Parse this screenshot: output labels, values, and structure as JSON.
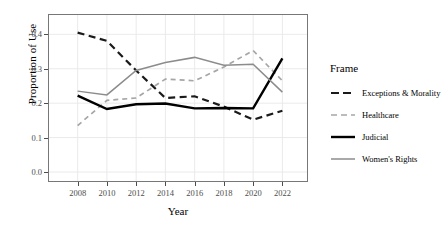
{
  "chart_data": {
    "type": "line",
    "title": "",
    "xlabel": "Year",
    "ylabel": "Proportion of Use",
    "legend_title": "Frame",
    "legend_position": "right",
    "grid": true,
    "x": [
      2008,
      2010,
      2012,
      2014,
      2016,
      2018,
      2020,
      2022
    ],
    "xticklabels": [
      "2008",
      "2010",
      "2012",
      "2014",
      "2016",
      "2018",
      "2020",
      "2022"
    ],
    "xlim": [
      2007,
      2023
    ],
    "ylim": [
      0.0,
      0.43
    ],
    "yticks": [
      0.0,
      0.1,
      0.2,
      0.3,
      0.4
    ],
    "yticklabels": [
      "0.0",
      "0.1",
      "0.2",
      "0.3",
      "0.4"
    ],
    "series": [
      {
        "name": "Exceptions & Morality",
        "values": [
          0.405,
          0.381,
          0.295,
          0.215,
          0.22,
          0.19,
          0.152,
          0.178
        ],
        "color": "#1a1a1a",
        "style": "dashed",
        "width": 2.2
      },
      {
        "name": "Healthcare",
        "values": [
          0.135,
          0.208,
          0.215,
          0.27,
          0.265,
          0.305,
          0.353,
          0.265
        ],
        "color": "#a6a6a6",
        "style": "dashed",
        "width": 1.7
      },
      {
        "name": "Judicial",
        "values": [
          0.222,
          0.183,
          0.197,
          0.199,
          0.185,
          0.186,
          0.185,
          0.33
        ],
        "color": "#000000",
        "style": "solid",
        "width": 2.4
      },
      {
        "name": "Women's Rights",
        "values": [
          0.235,
          0.224,
          0.295,
          0.318,
          0.333,
          0.31,
          0.313,
          0.232
        ],
        "color": "#8c8c8c",
        "style": "solid",
        "width": 1.5
      }
    ]
  },
  "legend": {
    "title": "Frame",
    "items": [
      {
        "label": "Exceptions & Morality"
      },
      {
        "label": "Healthcare"
      },
      {
        "label": "Judicial"
      },
      {
        "label": "Women's Rights"
      }
    ]
  },
  "axes": {
    "x_title": "Year",
    "y_title": "Proportion of Use"
  }
}
